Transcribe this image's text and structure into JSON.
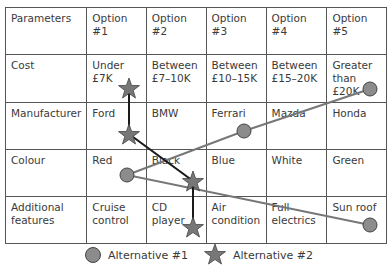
{
  "table": {
    "header": [
      "Parameters",
      "Option #1",
      "Option #2",
      "Option #3",
      "Option #4",
      "Option #5"
    ],
    "rows": [
      {
        "param": "Cost",
        "options": [
          "Under £7K",
          "Between £7–10K",
          "Between £10–15K",
          "Between £15–20K",
          "Greater than £20K"
        ]
      },
      {
        "param": "Manufacturer",
        "options": [
          "Ford",
          "BMW",
          "Ferrari",
          "Mazda",
          "Honda"
        ]
      },
      {
        "param": "Colour",
        "options": [
          "Red",
          "Black",
          "Blue",
          "White",
          "Green"
        ]
      },
      {
        "param": "Additional features",
        "options": [
          "Cruise control",
          "CD player",
          "Air condition",
          "Full electrics",
          "Sun roof"
        ]
      }
    ]
  },
  "alternatives": [
    {
      "name": "Alternative #1",
      "marker": "circle",
      "color": "#8c8c8c",
      "line_color": "#777777",
      "path": [
        "Greater than £20K",
        "Mazda",
        "Red",
        "Sun roof"
      ]
    },
    {
      "name": "Alternative #2",
      "marker": "star",
      "color": "#777777",
      "line_color": "#1a1a1a",
      "path": [
        "Under £7K",
        "Ford",
        "Black",
        "CD player"
      ]
    }
  ],
  "legend": {
    "alt1_label": "Alternative #1",
    "alt2_label": "Alternative #2"
  },
  "colors": {
    "grid_line": "#555555",
    "text": "#3a3a3a",
    "marker_fill": "#8c8c8c",
    "alt1_line": "#777777",
    "alt2_line": "#1a1a1a"
  }
}
